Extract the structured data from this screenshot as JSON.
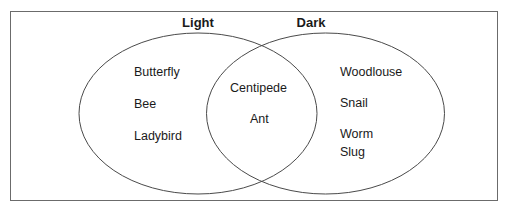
{
  "diagram": {
    "type": "venn",
    "sets": [
      {
        "name": "Light",
        "only_items": [
          "Butterfly",
          "Bee",
          "Ladybird"
        ]
      },
      {
        "name": "Dark",
        "only_items": [
          "Woodlouse",
          "Snail",
          "Worm",
          "Slug"
        ]
      }
    ],
    "intersection": [
      "Centipede",
      "Ant"
    ],
    "colors": {
      "stroke": "#4a4a4a",
      "frame": "#6b6b6b",
      "background": "#ffffff"
    }
  },
  "labels": {
    "light": "Light",
    "dark": "Dark"
  },
  "light_only": {
    "items": [
      "Butterfly",
      "Bee",
      "Ladybird"
    ]
  },
  "both": {
    "items": [
      "Centipede",
      "Ant"
    ]
  },
  "dark_only": {
    "items": [
      "Woodlouse",
      "Snail",
      "Worm",
      "Slug"
    ]
  }
}
